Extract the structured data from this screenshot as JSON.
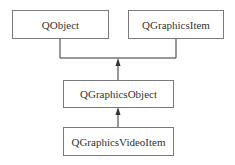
{
  "diagram": {
    "type": "class-inheritance",
    "nodes": [
      {
        "id": "qobject",
        "label": "QObject"
      },
      {
        "id": "qgraphicsitem",
        "label": "QGraphicsItem"
      },
      {
        "id": "qgraphicsobject",
        "label": "QGraphicsObject"
      },
      {
        "id": "qgraphicsvideoitem",
        "label": "QGraphicsVideoItem"
      }
    ],
    "edges": [
      {
        "from": "qgraphicsobject",
        "to": "qobject",
        "kind": "inherits"
      },
      {
        "from": "qgraphicsobject",
        "to": "qgraphicsitem",
        "kind": "inherits"
      },
      {
        "from": "qgraphicsvideoitem",
        "to": "qgraphicsobject",
        "kind": "inherits"
      }
    ],
    "colors": {
      "line": "#333333",
      "border": "#7a7a7a",
      "text": "#333333",
      "background": "#ffffff"
    }
  }
}
